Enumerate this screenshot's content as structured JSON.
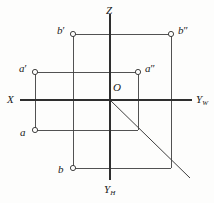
{
  "figure": {
    "width": 214,
    "height": 203,
    "background": "#fdfdfc",
    "line_color": "#3f3f3f",
    "axis_color": "#2e2e2e",
    "label_color": "#1a1a1a"
  },
  "axes": [
    {
      "name": "z-axis",
      "label": "Z",
      "subscript": "",
      "label_x": 106,
      "label_y": 5,
      "x1": 110,
      "y1": 14,
      "x2": 110,
      "y2": 100
    },
    {
      "name": "yh-axis",
      "label": "Y",
      "subscript": "H",
      "label_x": 104,
      "label_y": 184,
      "x1": 110,
      "y1": 100,
      "x2": 110,
      "y2": 180
    },
    {
      "name": "x-axis",
      "label": "X",
      "subscript": "",
      "label_x": 7,
      "label_y": 94,
      "x1": 20,
      "y1": 100,
      "x2": 110,
      "y2": 100
    },
    {
      "name": "yw-axis",
      "label": "Y",
      "subscript": "W",
      "label_x": 196,
      "label_y": 94,
      "x1": 110,
      "y1": 100,
      "x2": 192,
      "y2": 100
    }
  ],
  "origin": {
    "name": "origin",
    "label": "O",
    "x": 110,
    "y": 100,
    "label_x": 113,
    "label_y": 82
  },
  "points": [
    {
      "name": "point-b-front",
      "label": "b",
      "prime": "′",
      "x": 73,
      "y": 34,
      "label_x": 57,
      "label_y": 25
    },
    {
      "name": "point-b-side",
      "label": "b",
      "prime": "″",
      "x": 171,
      "y": 34,
      "label_x": 178,
      "label_y": 25
    },
    {
      "name": "point-a-front",
      "label": "a",
      "prime": "′",
      "x": 35,
      "y": 72,
      "label_x": 19,
      "label_y": 63
    },
    {
      "name": "point-a-side",
      "label": "a",
      "prime": "″",
      "x": 138,
      "y": 72,
      "label_x": 145,
      "label_y": 63
    },
    {
      "name": "point-a-top",
      "label": "a",
      "prime": "",
      "x": 35,
      "y": 130,
      "label_x": 20,
      "label_y": 127
    },
    {
      "name": "point-b-top",
      "label": "b",
      "prime": "",
      "x": 73,
      "y": 168,
      "label_x": 58,
      "label_y": 164
    }
  ],
  "connectors": [
    {
      "name": "connector-b-prime-to-b-dprime",
      "x1": 73,
      "y1": 34,
      "x2": 171,
      "y2": 34
    },
    {
      "name": "connector-a-prime-to-a-dprime",
      "x1": 35,
      "y1": 72,
      "x2": 138,
      "y2": 72
    },
    {
      "name": "connector-a-to-right",
      "x1": 35,
      "y1": 130,
      "x2": 138,
      "y2": 130
    },
    {
      "name": "connector-b-to-right",
      "x1": 73,
      "y1": 168,
      "x2": 171,
      "y2": 168
    },
    {
      "name": "connector-a-prime-vertical",
      "x1": 35,
      "y1": 72,
      "x2": 35,
      "y2": 130
    },
    {
      "name": "connector-b-prime-vertical",
      "x1": 73,
      "y1": 34,
      "x2": 73,
      "y2": 168
    },
    {
      "name": "connector-a-dprime-vertical",
      "x1": 138,
      "y1": 72,
      "x2": 138,
      "y2": 130
    },
    {
      "name": "connector-b-dprime-vertical",
      "x1": 171,
      "y1": 34,
      "x2": 171,
      "y2": 168
    }
  ],
  "diagonal": {
    "name": "bisector-line",
    "x1": 110,
    "y1": 100,
    "x2": 190,
    "y2": 178
  }
}
